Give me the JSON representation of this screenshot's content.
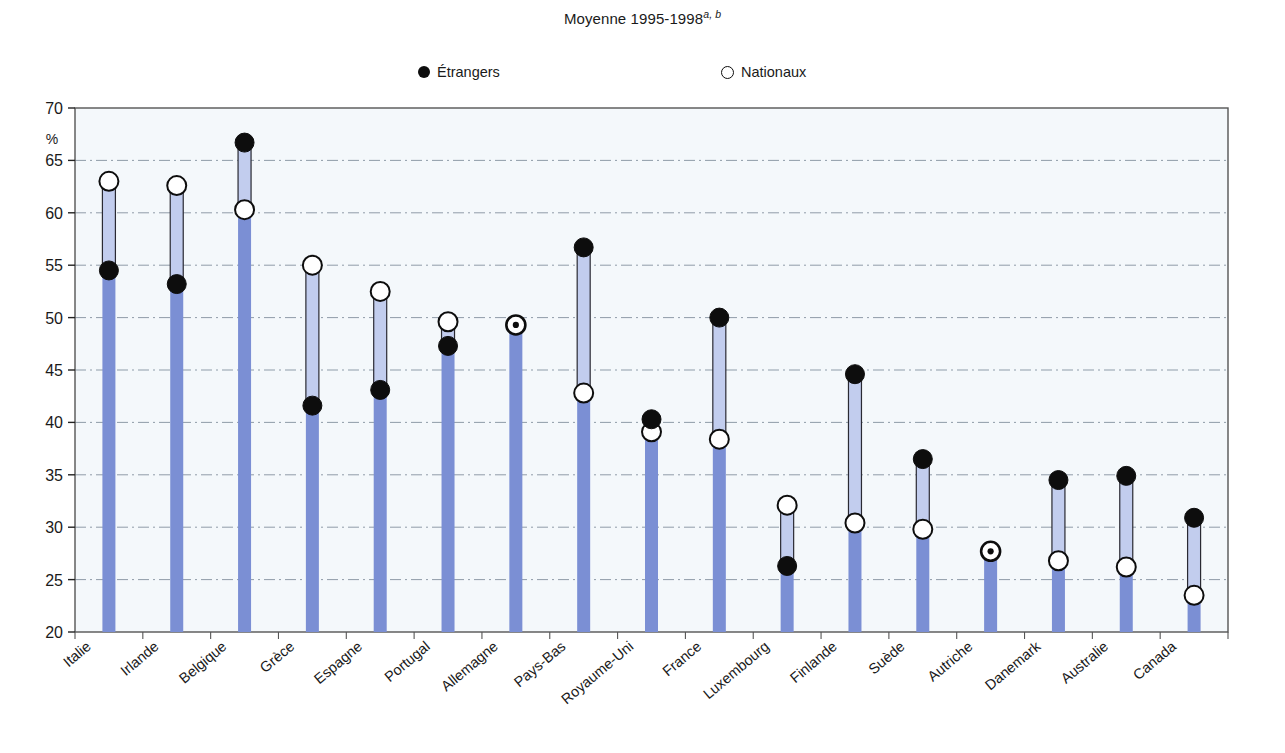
{
  "title": {
    "text": "Moyenne 1995-1998",
    "footnote_marks": "a, b"
  },
  "legend": {
    "position": "top-center",
    "items": [
      {
        "label": "Étrangers",
        "marker": "filled-circle-icon",
        "color": "#0d0d0d"
      },
      {
        "label": "Nationaux",
        "marker": "open-circle-icon",
        "color": "#ffffff"
      }
    ]
  },
  "axis": {
    "y_unit_label": "%",
    "y_ticks": [
      20,
      25,
      30,
      35,
      40,
      45,
      50,
      55,
      60,
      65,
      70
    ]
  },
  "colors": {
    "bar_base": "#7b8fd4",
    "bar_range": "#c2cdee",
    "plot_background": "#f4f8fb",
    "axis": "#555555",
    "grid": "#7f8c9b",
    "marker_filled": "#0d0d0d",
    "marker_open": "#ffffff",
    "marker_outline": "#0d0d0d"
  },
  "chart_data": {
    "type": "bar",
    "title": "Moyenne 1995-1998a, b",
    "subtitle": "",
    "xlabel": "",
    "ylabel": "%",
    "ylim": [
      20,
      70
    ],
    "ytick_step": 5,
    "grid": true,
    "legend_position": "top-center",
    "categories": [
      "Italie",
      "Irlande",
      "Belgique",
      "Grèce",
      "Espagne",
      "Portugal",
      "Allemagne",
      "Pays-Bas",
      "Royaume-Uni",
      "France",
      "Luxembourg",
      "Finlande",
      "Suède",
      "Autriche",
      "Danemark",
      "Australie",
      "Canada"
    ],
    "series": [
      {
        "name": "Étrangers",
        "values": [
          54.5,
          53.2,
          66.7,
          41.6,
          43.1,
          47.3,
          49.3,
          56.7,
          40.3,
          50.0,
          26.3,
          44.6,
          36.5,
          27.7,
          34.5,
          34.9,
          30.9
        ]
      },
      {
        "name": "Nationaux",
        "values": [
          63.0,
          62.6,
          60.3,
          55.0,
          52.5,
          49.6,
          49.3,
          42.8,
          39.1,
          38.4,
          32.1,
          30.4,
          29.8,
          27.7,
          26.8,
          26.2,
          23.5
        ]
      }
    ]
  }
}
